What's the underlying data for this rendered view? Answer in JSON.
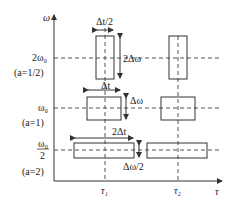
{
  "diagram": {
    "axes": {
      "y_label": "ω",
      "x_label": "τ"
    },
    "ticks": {
      "tau1": "τ₁",
      "tau2": "τ₂"
    },
    "levels": [
      {
        "freq": "2ω₀",
        "scale": "(a=1/2)",
        "width_label": "Δt/2",
        "height_label": "2Δω"
      },
      {
        "freq": "ω₀",
        "scale": "(a=1)",
        "width_label": "Δt",
        "height_label": "Δω"
      },
      {
        "freq_num": "ω₀",
        "freq_den": "2",
        "scale": "(a=2)",
        "width_label": "2Δt",
        "height_label": "Δω/2"
      }
    ]
  }
}
